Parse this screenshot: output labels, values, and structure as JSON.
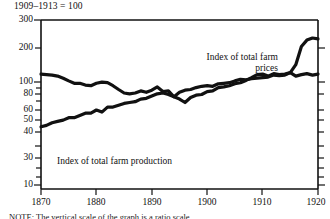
{
  "chart_data": {
    "type": "line",
    "title": "1909–1913 = 100",
    "xlabel": "",
    "ylabel": "",
    "scale": "log",
    "grid": false,
    "legend_position": "inline-annotation",
    "xlim": [
      1870,
      1920
    ],
    "ylim": [
      10,
      300
    ],
    "xticks": [
      1870,
      1880,
      1890,
      1900,
      1910,
      1920
    ],
    "yticks": [
      10,
      20,
      30,
      40,
      50,
      60,
      70,
      80,
      90,
      100,
      200,
      300
    ],
    "ytick_labels": [
      "10",
      "30",
      "40",
      "50",
      "60",
      "80",
      "100",
      "200",
      "300"
    ],
    "series": [
      {
        "name": "Index of total farm prices",
        "x": [
          1870,
          1871,
          1872,
          1873,
          1874,
          1875,
          1876,
          1877,
          1878,
          1879,
          1880,
          1881,
          1882,
          1883,
          1884,
          1885,
          1886,
          1887,
          1888,
          1889,
          1890,
          1891,
          1892,
          1893,
          1894,
          1895,
          1896,
          1897,
          1898,
          1899,
          1900,
          1901,
          1902,
          1903,
          1904,
          1905,
          1906,
          1907,
          1908,
          1909,
          1910,
          1911,
          1912,
          1913,
          1914,
          1915,
          1916,
          1917,
          1918,
          1919,
          1920
        ],
        "values": [
          101,
          100,
          99,
          97,
          93,
          88,
          84,
          84,
          81,
          80,
          84,
          86,
          85,
          80,
          74,
          69,
          68,
          69,
          72,
          70,
          73,
          78,
          71,
          72,
          64,
          61,
          57,
          63,
          66,
          67,
          71,
          72,
          77,
          78,
          80,
          83,
          85,
          89,
          94,
          100,
          101,
          97,
          102,
          100,
          101,
          104,
          122,
          176,
          200,
          209,
          205
        ]
      },
      {
        "name": "Index of total farm production",
        "x": [
          1870,
          1871,
          1872,
          1873,
          1874,
          1875,
          1876,
          1877,
          1878,
          1879,
          1880,
          1881,
          1882,
          1883,
          1884,
          1885,
          1886,
          1887,
          1888,
          1889,
          1890,
          1891,
          1892,
          1893,
          1894,
          1895,
          1896,
          1897,
          1898,
          1899,
          1900,
          1901,
          1902,
          1903,
          1904,
          1905,
          1906,
          1907,
          1908,
          1909,
          1910,
          1911,
          1912,
          1913,
          1914,
          1915,
          1916,
          1917,
          1918,
          1919,
          1920
        ],
        "values": [
          35,
          36,
          38,
          39,
          40,
          42,
          42,
          44,
          46,
          46,
          49,
          47,
          52,
          52,
          54,
          56,
          57,
          58,
          61,
          62,
          65,
          68,
          69,
          67,
          64,
          70,
          73,
          74,
          77,
          79,
          80,
          79,
          83,
          84,
          85,
          88,
          91,
          90,
          92,
          93,
          94,
          95,
          99,
          98,
          99,
          104,
          97,
          100,
          102,
          99,
          101
        ]
      }
    ]
  },
  "labels": {
    "axis_title": "1909–1913 = 100",
    "prices_line1": "Index of total farm",
    "prices_line2": "prices",
    "production": "Index of total farm production"
  },
  "ytick_labels": {
    "t300": "300",
    "t200": "200",
    "t100": "100",
    "t80": "80",
    "t60": "60",
    "t50": "50",
    "t40": "40",
    "t30": "30",
    "t10": "10"
  },
  "xtick_labels": {
    "x1870": "1870",
    "x1880": "1880",
    "x1890": "1890",
    "x1900": "1900",
    "x1910": "1910",
    "x1920": "1920"
  },
  "caption": "NOTE: The vertical scale of the graph is a ratio scale.",
  "colors": {
    "ink": "#111111",
    "background": "#ffffff",
    "series_prices": "#111111",
    "series_production": "#111111"
  }
}
